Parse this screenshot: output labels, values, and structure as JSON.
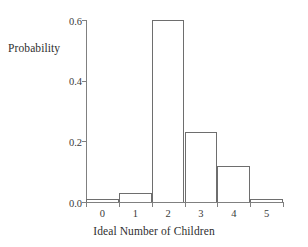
{
  "chart_data": {
    "type": "bar",
    "title": "",
    "xlabel": "Ideal Number of Children",
    "ylabel": "Probability",
    "categories": [
      "0",
      "1",
      "2",
      "3",
      "4",
      "5"
    ],
    "values": [
      0.01,
      0.03,
      0.6,
      0.23,
      0.12,
      0.01
    ],
    "xlim": [
      -0.5,
      5.5
    ],
    "ylim": [
      0.0,
      0.6
    ],
    "yticks": [
      "0.0",
      "0.2",
      "0.4",
      "0.6"
    ],
    "ytick_values": [
      0.0,
      0.2,
      0.4,
      0.6
    ],
    "xticks": [
      "0",
      "1",
      "2",
      "3",
      "4",
      "5"
    ],
    "grid": false,
    "legend": false,
    "bar_fill": "none",
    "bar_edge_color": "#6e6e6e",
    "axis_color": "#808080",
    "background": "#ffffff"
  },
  "axes": {
    "y_title": "Probability",
    "x_title": "Ideal Number of Children"
  }
}
